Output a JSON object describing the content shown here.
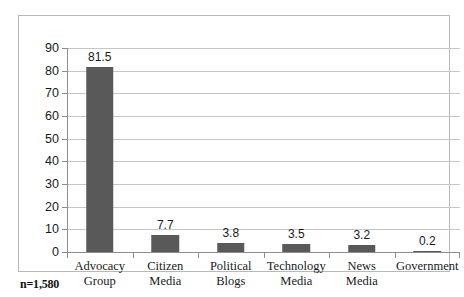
{
  "footnote": "n=1,580",
  "colors": {
    "bar": "#595959",
    "gridline": "#c6c6c6",
    "axis": "#8d8d8d",
    "frame": "#b8b8b8",
    "text": "#1a1a1a",
    "background": "#ffffff"
  },
  "chart_data": {
    "type": "bar",
    "title": "",
    "subtitle": "",
    "xlabel": "",
    "ylabel": "",
    "categories": [
      "Advocacy Group",
      "Citizen Media",
      "Political Blogs",
      "Technology Media",
      "News Media",
      "Government"
    ],
    "category_lines": [
      [
        "Advocacy",
        "Group"
      ],
      [
        "Citizen",
        "Media"
      ],
      [
        "Political",
        "Blogs"
      ],
      [
        "Technology",
        "Media"
      ],
      [
        "News",
        "Media"
      ],
      [
        "Government",
        ""
      ]
    ],
    "values": [
      81.5,
      7.7,
      3.8,
      3.5,
      3.2,
      0.2
    ],
    "data_labels": [
      "81.5",
      "7.7",
      "3.8",
      "3.5",
      "3.2",
      "0.2"
    ],
    "ylim": [
      0,
      90
    ],
    "ytick_step": 10,
    "yticks": [
      0,
      10,
      20,
      30,
      40,
      50,
      60,
      70,
      80,
      90
    ],
    "ytick_labels": [
      "0",
      "10",
      "20",
      "30",
      "40",
      "50",
      "60",
      "70",
      "80",
      "90"
    ],
    "grid": true,
    "grid_axis": "y",
    "legend": false,
    "legend_position": "none",
    "annotations": [
      "n=1,580"
    ]
  }
}
